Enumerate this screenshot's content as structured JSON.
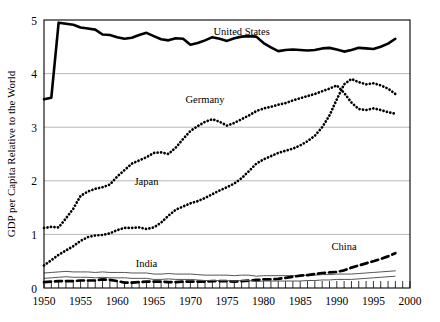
{
  "chart_data": {
    "type": "line",
    "title": "",
    "xlabel": "",
    "ylabel": "GDP per Capita Relative to the World",
    "xlim": [
      1950,
      2000
    ],
    "ylim": [
      0,
      5
    ],
    "yticks": [
      0,
      1,
      2,
      3,
      4,
      5
    ],
    "xticks": [
      1950,
      1955,
      1960,
      1965,
      1970,
      1975,
      1980,
      1985,
      1990,
      1995,
      2000
    ],
    "xtick_labels": [
      "1950",
      "1955",
      "1960",
      "1965",
      "1970",
      "1975",
      "1980",
      "1985",
      "1990",
      "1995",
      "2000"
    ],
    "ytick_labels": [
      "0",
      "1",
      "2",
      "3",
      "4",
      "5"
    ],
    "minor_xtick_step": 1,
    "grid": "horizontal",
    "legend_position": "inline-annotations",
    "x": [
      1950,
      1951,
      1952,
      1953,
      1954,
      1955,
      1956,
      1957,
      1958,
      1959,
      1960,
      1961,
      1962,
      1963,
      1964,
      1965,
      1966,
      1967,
      1968,
      1969,
      1970,
      1971,
      1972,
      1973,
      1974,
      1975,
      1976,
      1977,
      1978,
      1979,
      1980,
      1981,
      1982,
      1983,
      1984,
      1985,
      1986,
      1987,
      1988,
      1989,
      1990,
      1991,
      1992,
      1993,
      1994,
      1995,
      1996,
      1997,
      1998
    ],
    "series": [
      {
        "name": "United States",
        "style": "solid-thick",
        "label_x": 1977,
        "label_y": 4.72,
        "values": [
          3.52,
          3.55,
          4.95,
          4.93,
          4.91,
          4.86,
          4.84,
          4.82,
          4.73,
          4.72,
          4.68,
          4.65,
          4.67,
          4.72,
          4.76,
          4.7,
          4.64,
          4.62,
          4.66,
          4.65,
          4.54,
          4.57,
          4.62,
          4.68,
          4.65,
          4.61,
          4.66,
          4.69,
          4.7,
          4.69,
          4.57,
          4.49,
          4.42,
          4.44,
          4.45,
          4.44,
          4.43,
          4.44,
          4.47,
          4.48,
          4.45,
          4.41,
          4.44,
          4.48,
          4.47,
          4.46,
          4.5,
          4.56,
          4.65
        ]
      },
      {
        "name": "Germany",
        "style": "dotted",
        "label_x": 1972,
        "label_y": 3.45,
        "values": [
          1.12,
          1.14,
          1.13,
          1.3,
          1.48,
          1.72,
          1.8,
          1.85,
          1.88,
          1.93,
          2.08,
          2.2,
          2.32,
          2.38,
          2.44,
          2.52,
          2.53,
          2.5,
          2.62,
          2.78,
          2.93,
          3.02,
          3.1,
          3.15,
          3.1,
          3.03,
          3.08,
          3.15,
          3.22,
          3.3,
          3.35,
          3.38,
          3.42,
          3.45,
          3.5,
          3.54,
          3.58,
          3.62,
          3.67,
          3.72,
          3.78,
          3.64,
          3.46,
          3.34,
          3.32,
          3.35,
          3.32,
          3.28,
          3.25
        ]
      },
      {
        "name": "Japan",
        "style": "dotted",
        "label_x": 1964,
        "label_y": 1.93,
        "values": [
          0.42,
          0.52,
          0.62,
          0.7,
          0.78,
          0.88,
          0.95,
          0.98,
          0.99,
          1.02,
          1.08,
          1.12,
          1.12,
          1.13,
          1.1,
          1.13,
          1.22,
          1.35,
          1.46,
          1.52,
          1.58,
          1.62,
          1.68,
          1.75,
          1.82,
          1.88,
          1.95,
          2.05,
          2.18,
          2.32,
          2.4,
          2.46,
          2.52,
          2.56,
          2.6,
          2.66,
          2.74,
          2.84,
          3.0,
          3.22,
          3.52,
          3.8,
          3.9,
          3.84,
          3.8,
          3.82,
          3.78,
          3.72,
          3.62
        ]
      },
      {
        "name": "India",
        "style": "solid-thin",
        "label_x": 1964,
        "label_y": 0.4,
        "values": [
          0.28,
          0.29,
          0.3,
          0.31,
          0.3,
          0.3,
          0.3,
          0.29,
          0.3,
          0.29,
          0.29,
          0.29,
          0.28,
          0.28,
          0.28,
          0.26,
          0.26,
          0.27,
          0.26,
          0.26,
          0.26,
          0.25,
          0.24,
          0.24,
          0.24,
          0.24,
          0.23,
          0.24,
          0.24,
          0.22,
          0.23,
          0.23,
          0.23,
          0.23,
          0.23,
          0.23,
          0.24,
          0.24,
          0.25,
          0.25,
          0.26,
          0.26,
          0.26,
          0.27,
          0.28,
          0.29,
          0.3,
          0.31,
          0.32
        ]
      },
      {
        "name": "China",
        "style": "dashed",
        "label_x": 1991,
        "label_y": 0.7,
        "values": [
          0.11,
          0.12,
          0.13,
          0.13,
          0.13,
          0.14,
          0.14,
          0.14,
          0.16,
          0.15,
          0.13,
          0.1,
          0.1,
          0.11,
          0.12,
          0.12,
          0.12,
          0.11,
          0.11,
          0.12,
          0.12,
          0.12,
          0.12,
          0.13,
          0.13,
          0.13,
          0.12,
          0.13,
          0.14,
          0.15,
          0.16,
          0.16,
          0.17,
          0.19,
          0.21,
          0.23,
          0.24,
          0.26,
          0.28,
          0.29,
          0.3,
          0.33,
          0.38,
          0.42,
          0.46,
          0.5,
          0.54,
          0.59,
          0.65
        ]
      }
    ]
  }
}
